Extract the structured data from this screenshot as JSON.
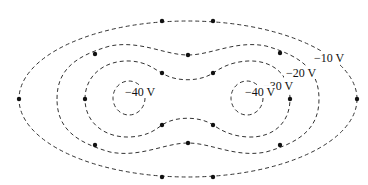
{
  "diagram": {
    "labels": {
      "v10": "−10 V",
      "v20": "−20 V",
      "v30": "−30 V",
      "v40_left": "−40 V",
      "v40_right": "−40 V"
    },
    "contours": [
      {
        "name": "-10 V",
        "value": -10
      },
      {
        "name": "-20 V",
        "value": -20
      },
      {
        "name": "-30 V",
        "value": -30
      },
      {
        "name": "-40 V left",
        "value": -40
      },
      {
        "name": "-40 V right",
        "value": -40
      }
    ],
    "points": [
      {
        "x": 162,
        "y": 21
      },
      {
        "x": 213,
        "y": 21
      },
      {
        "x": 19,
        "y": 99
      },
      {
        "x": 357,
        "y": 99
      },
      {
        "x": 162,
        "y": 177
      },
      {
        "x": 213,
        "y": 177
      },
      {
        "x": 95,
        "y": 54
      },
      {
        "x": 188,
        "y": 55
      },
      {
        "x": 280,
        "y": 53
      },
      {
        "x": 95,
        "y": 145
      },
      {
        "x": 188,
        "y": 143
      },
      {
        "x": 280,
        "y": 145
      },
      {
        "x": 162,
        "y": 73
      },
      {
        "x": 213,
        "y": 73
      },
      {
        "x": 85,
        "y": 99
      },
      {
        "x": 290,
        "y": 99
      },
      {
        "x": 162,
        "y": 125
      },
      {
        "x": 213,
        "y": 125
      }
    ],
    "colors": {
      "line": "#333333",
      "point": "#111111",
      "background": "#ffffff"
    }
  }
}
